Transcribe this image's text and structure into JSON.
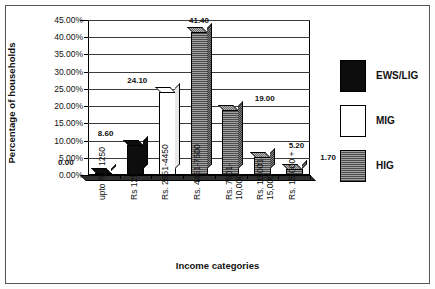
{
  "chart_data": {
    "type": "bar",
    "title": "",
    "xlabel": "Income categories",
    "ylabel": "Percentage of households",
    "categories": [
      "upto Rs. 1250",
      "Rs 1251-2650",
      "Rs. 2651-4450",
      "Rs. 4451-7500",
      "Rs. 7501-\n10,000",
      "Rs. 10,001-\n15,000",
      "Rs. 15,000 +"
    ],
    "values": [
      0.0,
      8.6,
      24.1,
      41.4,
      19.0,
      5.2,
      1.7
    ],
    "data_labels": [
      "0.00",
      "8.60",
      "24.10",
      "41.40",
      "19.00",
      "5.20",
      "1.70"
    ],
    "bar_series": [
      "EWS/LIG",
      "EWS/LIG",
      "MIG",
      "HIG",
      "HIG",
      "HIG",
      "HIG"
    ],
    "ylim": [
      0,
      45
    ],
    "ytick_labels": [
      "0.00%",
      "5.00%",
      "10.00%",
      "15.00%",
      "20.00%",
      "25.00%",
      "30.00%",
      "35.00%",
      "40.00%",
      "45.00%"
    ],
    "ytick_values": [
      0,
      5,
      10,
      15,
      20,
      25,
      30,
      35,
      40,
      45
    ],
    "grid": true,
    "legend_position": "right",
    "legend": [
      {
        "label": "EWS/LIG",
        "color": "#0d0d0d",
        "pattern": "solid-black"
      },
      {
        "label": "MIG",
        "color": "#ffffff",
        "pattern": "solid-white"
      },
      {
        "label": "HIG",
        "color": "#8d8d8d",
        "pattern": "hatched-gray"
      }
    ]
  }
}
